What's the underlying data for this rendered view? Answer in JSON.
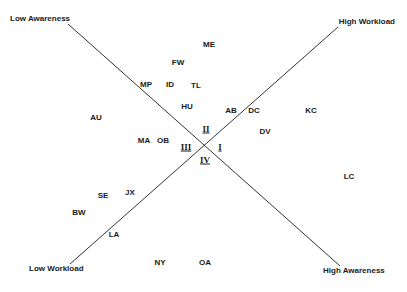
{
  "axes": {
    "top_left": "Low Awareness",
    "top_right": "High Workload",
    "bottom_left": "Low Workload",
    "bottom_right": "High Awareness"
  },
  "quadrants": [
    {
      "label": "I",
      "x": 220,
      "y": 147
    },
    {
      "label": "II",
      "x": 206,
      "y": 129
    },
    {
      "label": "III",
      "x": 186,
      "y": 147
    },
    {
      "label": "IV",
      "x": 205,
      "y": 160
    }
  ],
  "points": [
    {
      "label": "ME",
      "x": 209,
      "y": 45
    },
    {
      "label": "FW",
      "x": 178,
      "y": 63
    },
    {
      "label": "MP",
      "x": 146,
      "y": 85
    },
    {
      "label": "ID",
      "x": 170,
      "y": 85
    },
    {
      "label": "TL",
      "x": 196,
      "y": 86
    },
    {
      "label": "HU",
      "x": 187,
      "y": 107
    },
    {
      "label": "AB",
      "x": 231,
      "y": 111
    },
    {
      "label": "DC",
      "x": 254,
      "y": 111
    },
    {
      "label": "KC",
      "x": 311,
      "y": 111
    },
    {
      "label": "AU",
      "x": 96,
      "y": 118
    },
    {
      "label": "DV",
      "x": 265,
      "y": 132
    },
    {
      "label": "MA",
      "x": 144,
      "y": 141
    },
    {
      "label": "OB",
      "x": 163,
      "y": 141
    },
    {
      "label": "LC",
      "x": 349,
      "y": 177
    },
    {
      "label": "SE",
      "x": 103,
      "y": 196
    },
    {
      "label": "JX",
      "x": 130,
      "y": 193
    },
    {
      "label": "BW",
      "x": 79,
      "y": 213
    },
    {
      "label": "LA",
      "x": 114,
      "y": 235
    },
    {
      "label": "NY",
      "x": 160,
      "y": 263
    },
    {
      "label": "OA",
      "x": 205,
      "y": 263
    }
  ],
  "colors": {
    "line": "#333333",
    "text": "#1a1a1a"
  }
}
